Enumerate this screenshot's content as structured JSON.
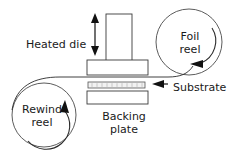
{
  "diagram": {
    "background_color": "#ffffff",
    "line_color": "#2b2b2b",
    "text_color": "#1a1a1a",
    "labels": {
      "heated_die": "Heated die",
      "foil_reel_line1": "Foil",
      "foil_reel_line2": "reel",
      "rewind_reel_line1": "Rewind",
      "rewind_reel_line2": "reel",
      "substrate": "Substrate",
      "backing_plate_line1": "Backing",
      "backing_plate_line2": "plate"
    },
    "icons": {
      "vertical_double_arrow": "double-arrow-vertical-icon",
      "foil_reel_rotation": "curved-arrow-icon",
      "rewind_reel_rotation": "curved-arrow-icon",
      "substrate_pointer": "left-arrow-icon"
    },
    "parts": {
      "die_column": "die-column",
      "die_base": "die-base",
      "foil_web": "foil-web-strip",
      "backing_plate": "backing-plate",
      "substrate_web": "substrate-web-line",
      "foil_reel": "foil-reel-circle",
      "rewind_reel": "rewind-reel-circle"
    }
  }
}
